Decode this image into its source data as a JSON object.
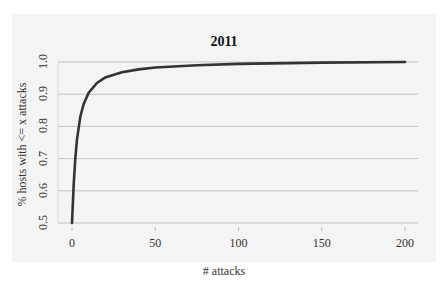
{
  "chart_data": {
    "type": "line",
    "title": "2011",
    "xlabel": "# attacks",
    "ylabel": "% hosts with <= x attacks",
    "xlim": [
      0,
      200
    ],
    "ylim": [
      0.5,
      1.0
    ],
    "x_ticks": [
      "0",
      "50",
      "100",
      "150",
      "200"
    ],
    "y_ticks": [
      "0.5",
      "0.6",
      "0.7",
      "0.8",
      "0.9",
      "1.0"
    ],
    "grid": "horizontal",
    "legend": null,
    "series": [
      {
        "name": "CDF 2011",
        "color": "#333333",
        "x": [
          0,
          1,
          2,
          3,
          5,
          7,
          10,
          15,
          20,
          30,
          40,
          50,
          75,
          100,
          150,
          200
        ],
        "y": [
          0.5,
          0.62,
          0.7,
          0.76,
          0.83,
          0.87,
          0.905,
          0.935,
          0.952,
          0.968,
          0.977,
          0.983,
          0.99,
          0.994,
          0.998,
          1.0
        ]
      }
    ]
  }
}
